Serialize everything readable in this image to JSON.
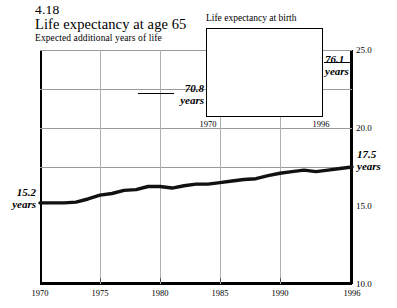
{
  "figure": {
    "number": "4.18",
    "title": "Life expectancy at age 65",
    "subtitle": "Expected additional years of life"
  },
  "chart_data": {
    "type": "line",
    "title": "Life expectancy at age 65",
    "subtitle": "Expected additional years of life",
    "xlabel": "",
    "ylabel": "",
    "xlim": [
      1970,
      1996
    ],
    "ylim": [
      10.0,
      25.0
    ],
    "y_ticks": [
      "10.0",
      "15.0",
      "20.0",
      "25.0"
    ],
    "y_tick_values": [
      10.0,
      15.0,
      20.0,
      25.0
    ],
    "x_ticks": [
      "1970",
      "1975",
      "1980",
      "1985",
      "1990",
      "1996"
    ],
    "x_tick_values": [
      1970,
      1975,
      1980,
      1985,
      1990,
      1996
    ],
    "grid": true,
    "legend": "none",
    "start_label": "15.2",
    "start_label_unit": "years",
    "end_label": "17.5",
    "end_label_unit": "years",
    "x": [
      1970,
      1971,
      1972,
      1973,
      1974,
      1975,
      1976,
      1977,
      1978,
      1979,
      1980,
      1981,
      1982,
      1983,
      1984,
      1985,
      1986,
      1987,
      1988,
      1989,
      1990,
      1991,
      1992,
      1993,
      1994,
      1995,
      1996
    ],
    "values": [
      15.2,
      15.2,
      15.2,
      15.25,
      15.45,
      15.7,
      15.8,
      16.0,
      16.05,
      16.25,
      16.25,
      16.15,
      16.3,
      16.4,
      16.4,
      16.5,
      16.6,
      16.7,
      16.75,
      16.95,
      17.1,
      17.2,
      17.3,
      17.2,
      17.3,
      17.4,
      17.5
    ],
    "inset": {
      "type": "line",
      "title": "Life expectancy at birth",
      "xlim": [
        1970,
        1996
      ],
      "ylim": [
        69.6,
        77.0
      ],
      "x_ticks": [
        "1970",
        "1996"
      ],
      "x_tick_values": [
        1970,
        1996
      ],
      "grid": false,
      "start_label": "70.8",
      "start_label_unit": "years",
      "end_label": "76.1",
      "end_label_unit": "years",
      "x": [
        1970,
        1971,
        1972,
        1973,
        1974,
        1975,
        1976,
        1977,
        1978,
        1979,
        1980,
        1981,
        1982,
        1983,
        1984,
        1985,
        1986,
        1987,
        1988,
        1989,
        1990,
        1991,
        1992,
        1993,
        1994,
        1995,
        1996
      ],
      "values": [
        70.8,
        71.1,
        71.2,
        71.4,
        72.0,
        72.6,
        72.9,
        73.3,
        73.5,
        73.9,
        73.7,
        74.1,
        74.5,
        74.6,
        74.7,
        74.7,
        74.8,
        74.9,
        74.9,
        75.1,
        75.4,
        75.5,
        75.8,
        75.5,
        75.7,
        75.8,
        76.1
      ]
    }
  }
}
